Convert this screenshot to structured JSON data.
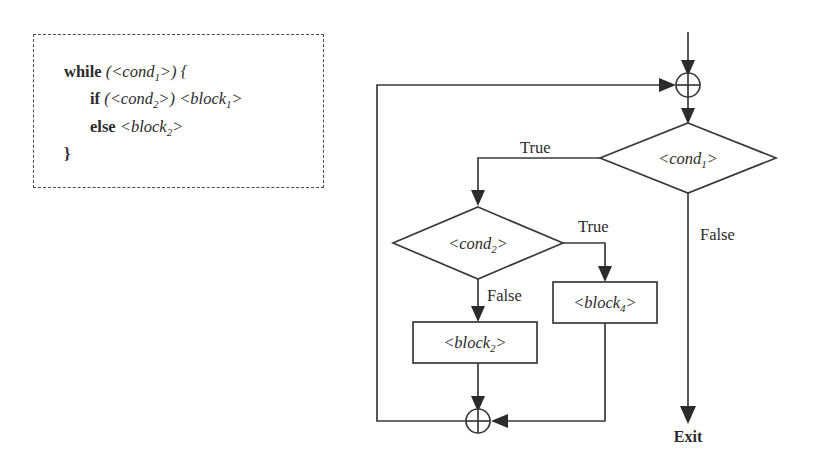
{
  "figure": {
    "line_color": "#3a3a3a",
    "text_color": "#2b2b2b",
    "background": "#ffffff"
  },
  "code_panel": {
    "border_style": "dashed",
    "lines": [
      {
        "id": "line-while",
        "keyword": "while",
        "rest_before_sub": " (<cond",
        "sub": "1",
        "rest_after_sub": ">) {"
      },
      {
        "id": "line-if",
        "keyword": "if",
        "rest_before_sub": " (<cond",
        "sub": "2",
        "rest_mid": ">) <block",
        "sub2": "1",
        "rest_after_sub": ">"
      },
      {
        "id": "line-else",
        "keyword": "else",
        "rest_before_sub": " <block",
        "sub": "2",
        "rest_after_sub": ">"
      },
      {
        "id": "line-close",
        "keyword": "",
        "rest_before_sub": "}",
        "sub": "",
        "rest_after_sub": ""
      }
    ],
    "plain_text": "while (<cond1>) {\n    if (<cond2>) <block1>\n    else <block2>\n}"
  },
  "flowchart": {
    "nodes": [
      {
        "id": "merge-top",
        "type": "merge-circle",
        "label": "",
        "cx": 688,
        "cy": 85,
        "r": 12
      },
      {
        "id": "cond1",
        "type": "decision",
        "label": "<cond",
        "sub": "1",
        "label_tail": ">",
        "cx": 688,
        "cy": 158,
        "rx": 88,
        "ry": 35
      },
      {
        "id": "cond2",
        "type": "decision",
        "label": "<cond",
        "sub": "2",
        "label_tail": ">",
        "cx": 478,
        "cy": 243,
        "rx": 85,
        "ry": 36
      },
      {
        "id": "block4",
        "type": "process",
        "label": "<block",
        "sub": "4",
        "label_tail": ">",
        "x": 553,
        "y": 282,
        "w": 104,
        "h": 41
      },
      {
        "id": "block2",
        "type": "process",
        "label": "<block",
        "sub": "2",
        "label_tail": ">",
        "x": 413,
        "y": 322,
        "w": 124,
        "h": 41
      },
      {
        "id": "merge-bottom",
        "type": "merge-circle",
        "label": "",
        "cx": 478,
        "cy": 421,
        "r": 12
      }
    ],
    "edge_labels": [
      {
        "id": "label-cond1-true",
        "text": "True",
        "x": 520,
        "y": 153
      },
      {
        "id": "label-cond1-false",
        "text": "False",
        "x": 700,
        "y": 240
      },
      {
        "id": "label-cond2-true",
        "text": "True",
        "x": 578,
        "y": 232
      },
      {
        "id": "label-cond2-false",
        "text": "False",
        "x": 487,
        "y": 300
      }
    ],
    "terminal": {
      "id": "exit-terminal",
      "text": "Exit",
      "x": 688,
      "y": 440
    }
  }
}
